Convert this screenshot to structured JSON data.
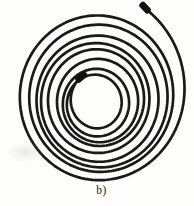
{
  "figure": {
    "label": "b)",
    "background": "#fdfdfb",
    "label_color": "#232323",
    "cable": {
      "stroke_color": "#1a1a1a",
      "stroke_width": 2.7,
      "spiral": {
        "center_start": {
          "x": 97.0,
          "y": 104.5
        },
        "center_end": {
          "x": 99.5,
          "y": 96.0
        },
        "radius_start": 22,
        "radius_end": 83,
        "radius_ease": 1.08,
        "turns": 8.85,
        "start_angle_deg": 113,
        "aspect_ry": 1.05,
        "wobble_amp": 1.6,
        "wobble_freq": 6.5,
        "wobble_phase": 2.0,
        "start_boost": {
          "amp": 8,
          "span": 0.04
        },
        "end_boost": {
          "amp": 13,
          "start": 0.955
        }
      },
      "connector": {
        "color": "#111111",
        "length": 13,
        "width": 6.8,
        "corner_radius": 2.4,
        "overhang": 4.5
      }
    }
  }
}
